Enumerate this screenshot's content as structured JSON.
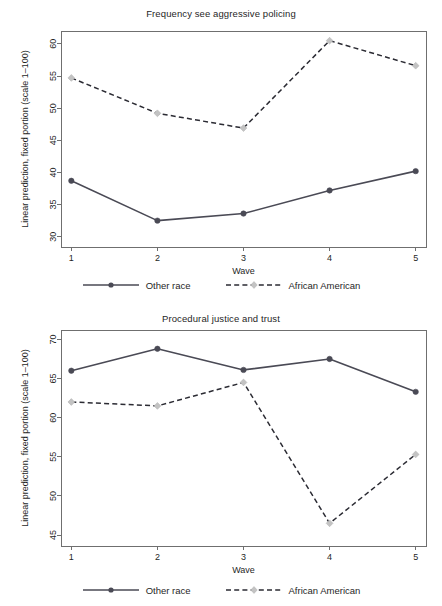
{
  "figure": {
    "width": 442,
    "height": 606,
    "background": "#ffffff",
    "panel_count": 2
  },
  "colors": {
    "other_race_line": "#4a4a55",
    "other_race_marker": "#4a4a55",
    "african_american_line": "#2b2b33",
    "african_american_marker": "#c3c3c3",
    "axis": "#6f6f6f",
    "text": "#1f1f1f"
  },
  "legend": {
    "position": "bottom-center",
    "entries": [
      {
        "label": "Other race",
        "style": "solid",
        "marker": "circle"
      },
      {
        "label": "African American",
        "style": "dashed",
        "marker": "diamond"
      }
    ]
  },
  "chart_data": [
    {
      "type": "line",
      "title": "Frequency see aggressive policing",
      "xlabel": "Wave",
      "ylabel": "Linear prediction, fixed portion (scale 1–100)",
      "x": [
        1,
        2,
        3,
        4,
        5
      ],
      "xticklabels": [
        "1",
        "2",
        "3",
        "4",
        "5"
      ],
      "xlim": [
        0.88,
        5.12
      ],
      "ylim": [
        28.4,
        62.0
      ],
      "yticks": [
        30,
        35,
        40,
        45,
        50,
        55,
        60
      ],
      "yticklabels": [
        "30",
        "35",
        "40",
        "45",
        "50",
        "55",
        "60"
      ],
      "grid": false,
      "series": [
        {
          "name": "Other race",
          "values": [
            38.7,
            32.5,
            33.6,
            37.2,
            40.2
          ],
          "style": "solid",
          "marker": "circle"
        },
        {
          "name": "African American",
          "values": [
            54.7,
            49.2,
            46.9,
            60.5,
            56.6
          ],
          "style": "dashed",
          "marker": "diamond"
        }
      ]
    },
    {
      "type": "line",
      "title": "Procedural justice and trust",
      "xlabel": "Wave",
      "ylabel": "Linear prediction, fixed portion (scale 1–100)",
      "x": [
        1,
        2,
        3,
        4,
        5
      ],
      "xticklabels": [
        "1",
        "2",
        "3",
        "4",
        "5"
      ],
      "xlim": [
        0.88,
        5.12
      ],
      "ylim": [
        43.6,
        71.2
      ],
      "yticks": [
        45,
        50,
        55,
        60,
        65,
        70
      ],
      "yticklabels": [
        "45",
        "50",
        "55",
        "60",
        "65",
        "70"
      ],
      "grid": false,
      "series": [
        {
          "name": "Other race",
          "values": [
            66.0,
            68.8,
            66.1,
            67.5,
            63.3
          ],
          "style": "solid",
          "marker": "circle"
        },
        {
          "name": "African American",
          "values": [
            62.0,
            61.5,
            64.5,
            46.5,
            55.3
          ],
          "style": "dashed",
          "marker": "diamond"
        }
      ]
    }
  ]
}
